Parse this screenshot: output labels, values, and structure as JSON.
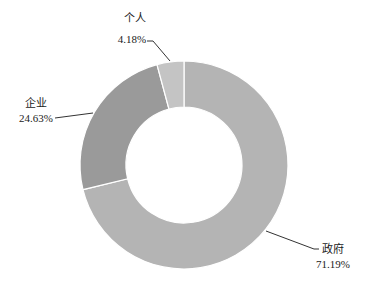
{
  "chart_data": {
    "type": "pie",
    "variant": "donut",
    "title": "",
    "categories": [
      "政府",
      "企业",
      "个人"
    ],
    "values": [
      71.19,
      24.63,
      4.18
    ],
    "value_labels": [
      "71.19%",
      "24.63%",
      "4.18%"
    ],
    "colors": [
      "#b4b4b4",
      "#9a9a9a",
      "#c4c4c4"
    ],
    "start_angle_deg": 0,
    "direction": "clockwise",
    "legend": "none",
    "data_labels": "outside with leader lines"
  },
  "labels": {
    "gov": {
      "name": "政府",
      "pct": "71.19%"
    },
    "ent": {
      "name": "企业",
      "pct": "24.63%"
    },
    "ind": {
      "name": "个人",
      "pct": "4.18%"
    }
  }
}
